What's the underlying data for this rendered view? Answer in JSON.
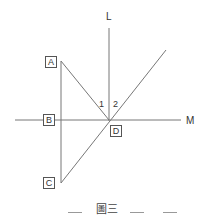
{
  "figure": {
    "caption": "圖三",
    "lines": {
      "L": "L",
      "M": "M"
    },
    "points": {
      "A": "A",
      "B": "B",
      "C": "C",
      "D": "D"
    },
    "angles": {
      "angle1": "1",
      "angle2": "2"
    },
    "colors": {
      "line": "#777777",
      "text": "#333333"
    }
  }
}
